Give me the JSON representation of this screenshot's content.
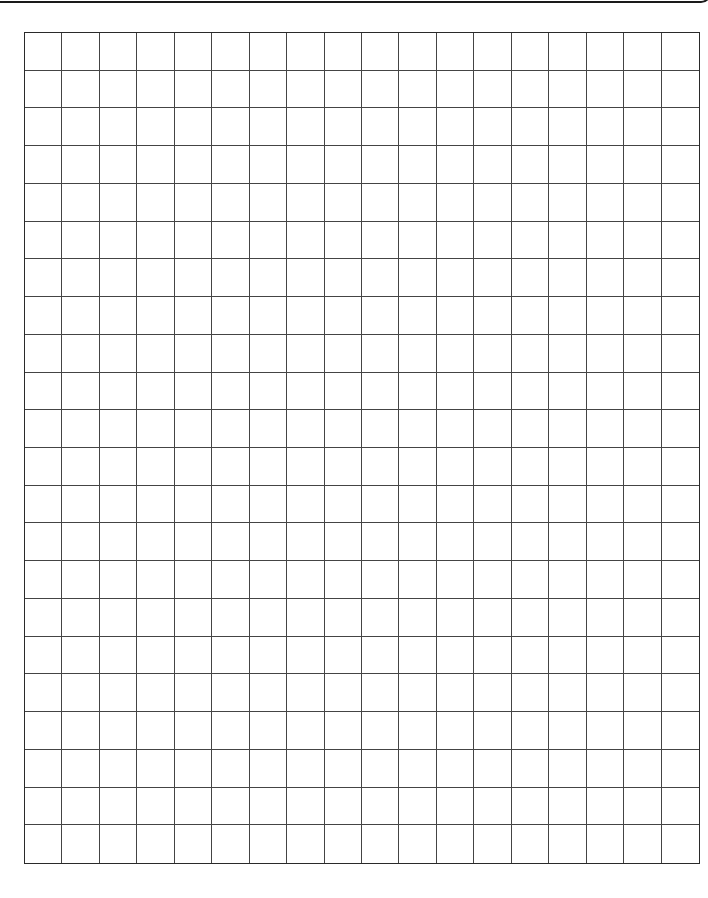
{
  "page": {
    "type": "graph-paper",
    "grid": {
      "columns": 18,
      "rows": 22
    },
    "colors": {
      "line": "#444444",
      "border": "#2a2a2a",
      "background": "#ffffff"
    }
  }
}
